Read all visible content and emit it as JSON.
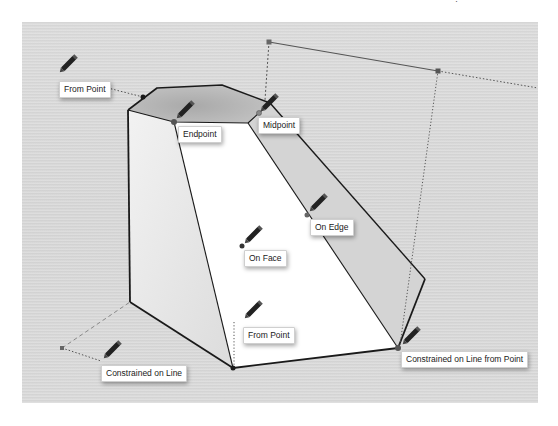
{
  "diagram": {
    "stray_text": "·",
    "colors": {
      "background": "#d8d8d8",
      "top_face": "#b9b9b9",
      "left_face": "#e4e4e4",
      "front_face": "#ffffff",
      "right_face": "#d3d3d3",
      "edge": "#1a1a1a",
      "inference_dot": "#555555"
    },
    "labels": [
      {
        "id": "from-point-top",
        "text": "From Point"
      },
      {
        "id": "endpoint",
        "text": "Endpoint"
      },
      {
        "id": "midpoint",
        "text": "Midpoint"
      },
      {
        "id": "on-edge",
        "text": "On Edge"
      },
      {
        "id": "on-face",
        "text": "On Face"
      },
      {
        "id": "from-point-bottom",
        "text": "From Point"
      },
      {
        "id": "constrained-on-line",
        "text": "Constrained on Line"
      },
      {
        "id": "constrained-on-line-from-point",
        "text": "Constrained on Line from Point"
      }
    ],
    "icons": {
      "cursor": "pencil-icon"
    }
  }
}
